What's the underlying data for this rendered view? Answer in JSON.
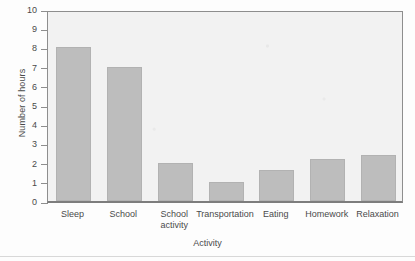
{
  "chart_data": {
    "type": "bar",
    "title": "",
    "xlabel": "Activity",
    "ylabel": "Number of hours",
    "categories": [
      "Sleep",
      "School",
      "School activity",
      "Transportation",
      "Eating",
      "Homework",
      "Relaxation"
    ],
    "values": [
      8,
      7,
      2,
      1,
      1.6,
      2.2,
      2.4
    ],
    "ylim": [
      0,
      10
    ],
    "yticks": [
      0,
      1,
      2,
      3,
      4,
      5,
      6,
      7,
      8,
      9,
      10
    ],
    "ytick_labels": [
      "0",
      "1",
      "2",
      "3",
      "4",
      "5",
      "6",
      "7",
      "8",
      "9",
      "10"
    ],
    "grid": false,
    "legend": null,
    "bar_color": "#bdbdbd",
    "plot_background": "#f2f2f2"
  },
  "axis": {
    "y_title": "Number of hours",
    "x_title": "Activity"
  },
  "categories_display": [
    {
      "line1": "Sleep",
      "line2": ""
    },
    {
      "line1": "School",
      "line2": ""
    },
    {
      "line1": "School",
      "line2": "activity"
    },
    {
      "line1": "Transportation",
      "line2": ""
    },
    {
      "line1": "Eating",
      "line2": ""
    },
    {
      "line1": "Homework",
      "line2": ""
    },
    {
      "line1": "Relaxation",
      "line2": ""
    }
  ]
}
